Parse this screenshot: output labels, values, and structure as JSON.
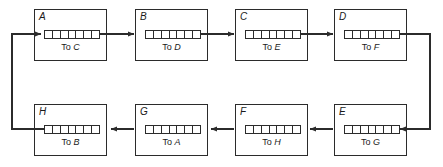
{
  "diagram": {
    "stroke_color": "#2b2b2b",
    "background_color": "#ffffff",
    "queue_cell_count": 7,
    "label_prefix": "To",
    "nodes": [
      {
        "id": "A",
        "target": "C",
        "label": "To C",
        "row": "top",
        "x": 34,
        "y": 9,
        "w": 73,
        "h": 52
      },
      {
        "id": "B",
        "target": "D",
        "label": "To D",
        "row": "top",
        "x": 135,
        "y": 9,
        "w": 73,
        "h": 52
      },
      {
        "id": "C",
        "target": "E",
        "label": "To E",
        "row": "top",
        "x": 235,
        "y": 9,
        "w": 73,
        "h": 52
      },
      {
        "id": "D",
        "target": "F",
        "label": "To F",
        "row": "top",
        "x": 334,
        "y": 9,
        "w": 73,
        "h": 52
      },
      {
        "id": "E",
        "target": "G",
        "label": "To G",
        "row": "bottom",
        "x": 334,
        "y": 104,
        "w": 73,
        "h": 52
      },
      {
        "id": "F",
        "target": "H",
        "label": "To H",
        "row": "bottom",
        "x": 235,
        "y": 104,
        "w": 73,
        "h": 52
      },
      {
        "id": "G",
        "target": "A",
        "label": "To A",
        "row": "bottom",
        "x": 135,
        "y": 104,
        "w": 73,
        "h": 52
      },
      {
        "id": "H",
        "target": "B",
        "label": "To B",
        "row": "bottom",
        "x": 34,
        "y": 104,
        "w": 73,
        "h": 52
      }
    ],
    "connections": [
      {
        "from": "A",
        "to": "B",
        "kind": "horizontal-right"
      },
      {
        "from": "B",
        "to": "C",
        "kind": "horizontal-right"
      },
      {
        "from": "C",
        "to": "D",
        "kind": "horizontal-right"
      },
      {
        "from": "D",
        "to": "E",
        "kind": "wrap-right"
      },
      {
        "from": "E",
        "to": "F",
        "kind": "horizontal-left"
      },
      {
        "from": "F",
        "to": "G",
        "kind": "horizontal-left"
      },
      {
        "from": "G",
        "to": "H",
        "kind": "horizontal-left"
      },
      {
        "from": "H",
        "to": "A",
        "kind": "wrap-left"
      }
    ]
  }
}
